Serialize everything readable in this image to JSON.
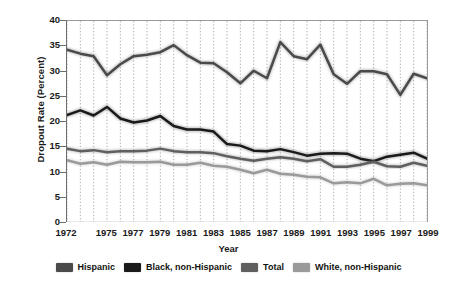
{
  "chart_data": {
    "type": "line",
    "title": "",
    "xlabel": "Year",
    "ylabel": "Dropout Rate (Percent)",
    "xlim": [
      1972,
      1999
    ],
    "ylim": [
      0,
      40
    ],
    "ytick_values": [
      0,
      5,
      10,
      15,
      20,
      25,
      30,
      35,
      40
    ],
    "ytick_labels": [
      "0",
      "5",
      "10",
      "15",
      "20",
      "25",
      "30",
      "35",
      "40"
    ],
    "xtick_values": [
      1972,
      1975,
      1977,
      1979,
      1981,
      1983,
      1985,
      1987,
      1989,
      1991,
      1993,
      1995,
      1997,
      1999
    ],
    "xtick_labels": [
      "1972",
      "1975",
      "1977",
      "1979",
      "1981",
      "1983",
      "1985",
      "1987",
      "1989",
      "1991",
      "1993",
      "1995",
      "1997",
      "1999"
    ],
    "grid": "vertical-dotted-every-year",
    "legend_position": "below",
    "x": [
      1972,
      1973,
      1974,
      1975,
      1976,
      1977,
      1978,
      1979,
      1980,
      1981,
      1982,
      1983,
      1984,
      1985,
      1986,
      1987,
      1988,
      1989,
      1990,
      1991,
      1992,
      1993,
      1994,
      1995,
      1996,
      1997,
      1998,
      1999
    ],
    "series": [
      {
        "name": "Hispanic",
        "color": "#4a4a4a",
        "values": [
          34.3,
          33.5,
          33.0,
          29.2,
          31.4,
          33.0,
          33.3,
          33.8,
          35.2,
          33.2,
          31.7,
          31.6,
          29.8,
          27.6,
          30.1,
          28.6,
          35.8,
          33.0,
          32.4,
          35.3,
          29.4,
          27.5,
          30.0,
          30.0,
          29.4,
          25.3,
          29.5,
          28.6
        ]
      },
      {
        "name": "Black, non-Hispanic",
        "color": "#1a1a1a",
        "values": [
          21.3,
          22.2,
          21.2,
          22.9,
          20.6,
          19.8,
          20.2,
          21.1,
          19.1,
          18.4,
          18.4,
          18.0,
          15.5,
          15.2,
          14.2,
          14.1,
          14.5,
          13.9,
          13.2,
          13.6,
          13.7,
          13.6,
          12.6,
          12.1,
          13.0,
          13.4,
          13.8,
          12.6
        ]
      },
      {
        "name": "Total",
        "color": "#5f5f5f",
        "values": [
          14.6,
          14.1,
          14.3,
          13.9,
          14.1,
          14.1,
          14.2,
          14.6,
          14.1,
          13.9,
          13.9,
          13.7,
          13.1,
          12.6,
          12.2,
          12.6,
          12.9,
          12.6,
          12.1,
          12.5,
          11.0,
          11.0,
          11.4,
          12.0,
          11.1,
          11.0,
          11.8,
          11.2
        ]
      },
      {
        "name": "White, non-Hispanic",
        "color": "#9a9a9a",
        "values": [
          12.3,
          11.6,
          11.9,
          11.4,
          12.0,
          11.9,
          11.9,
          12.0,
          11.4,
          11.4,
          11.8,
          11.2,
          11.0,
          10.4,
          9.7,
          10.4,
          9.6,
          9.4,
          9.0,
          8.9,
          7.7,
          7.9,
          7.7,
          8.6,
          7.3,
          7.6,
          7.7,
          7.3
        ]
      }
    ]
  },
  "legend": {
    "entries": [
      {
        "label": "Hispanic",
        "color": "#4a4a4a"
      },
      {
        "label": "Black, non-Hispanic",
        "color": "#1a1a1a"
      },
      {
        "label": "Total",
        "color": "#5f5f5f"
      },
      {
        "label": "White, non-Hispanic",
        "color": "#9a9a9a"
      }
    ]
  }
}
